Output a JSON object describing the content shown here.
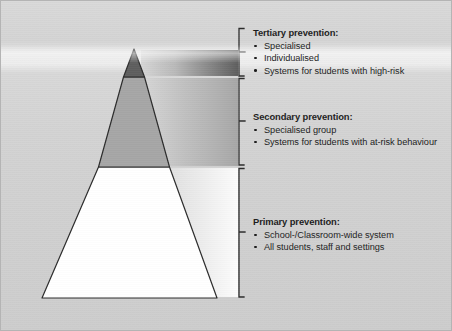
{
  "figure": {
    "type": "three-tier-prevention-pyramid",
    "background_color": "#d4d4d4",
    "border_color": "#b4b4b4"
  },
  "pyramid": {
    "apex": {
      "x": 133,
      "y": 48
    },
    "base_left": {
      "x": 41,
      "y": 297
    },
    "base_right": {
      "x": 216,
      "y": 297
    },
    "outline_color": "#2b2b2b",
    "tiers": [
      {
        "id": "tertiary",
        "name": "Tertiary",
        "fill_color": "#5e5e5e",
        "band_color_start": "#d2d2d2",
        "band_color_end": "#5e5e5e",
        "top_y": 48,
        "bottom_y": 76
      },
      {
        "id": "secondary",
        "name": "Secondary",
        "fill_color": "#a6a6a6",
        "band_color_start": "#d8d8d8",
        "band_color_end": "#a8a8a8",
        "top_y": 76,
        "bottom_y": 166
      },
      {
        "id": "primary",
        "name": "Primary",
        "fill_color": "#ffffff",
        "band_color_start": "#d8d8d8",
        "band_color_end": "#fbfbfb",
        "top_y": 166,
        "bottom_y": 297
      }
    ]
  },
  "brackets": [
    {
      "id": "tertiary-bracket",
      "top_y": 27,
      "bottom_y": 75,
      "x": 238,
      "tick_y": 51
    },
    {
      "id": "secondary-bracket",
      "top_y": 77,
      "bottom_y": 164,
      "x": 238,
      "tick_y": 120
    },
    {
      "id": "primary-bracket",
      "top_y": 167,
      "bottom_y": 296,
      "x": 238,
      "tick_y": 231
    }
  ],
  "labels": {
    "tertiary": {
      "heading": "Tertiary prevention:",
      "bullets": [
        "Specialised",
        "Individualised",
        "Systems for students with high-risk"
      ]
    },
    "secondary": {
      "heading": "Secondary prevention:",
      "bullets": [
        "Specialised group",
        "Systems for students with at-risk behaviour"
      ]
    },
    "primary": {
      "heading": "Primary prevention:",
      "bullets": [
        "School-/Classroom-wide system",
        "All students, staff and settings"
      ]
    }
  }
}
